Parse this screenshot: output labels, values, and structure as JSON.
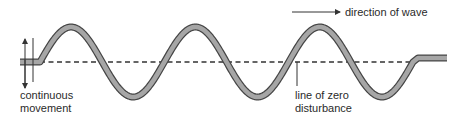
{
  "diagram": {
    "labels": {
      "direction": "direction of wave",
      "continuous_line1": "continuous",
      "continuous_line2": "movement",
      "zero_line1": "line of zero",
      "zero_line2": "disturbance"
    },
    "colors": {
      "wave_fill": "#a6a6a6",
      "wave_outline": "#444444",
      "line": "#333333",
      "text": "#2a2a2a"
    },
    "geometry": {
      "zero_y": 62,
      "amplitude_px": 35,
      "wave_start_x": 40,
      "wave_end_x": 413,
      "cycles": 3
    }
  }
}
